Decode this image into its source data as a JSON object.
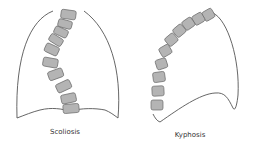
{
  "figures": [
    {
      "id": "scoliosis",
      "label": "Scoliosis"
    },
    {
      "id": "kyphosis",
      "label": "Kyphosis"
    }
  ],
  "colors": {
    "outline": "#555555",
    "vertebra_fill": "#b4b4b4",
    "vertebra_stroke": "#6a6a6a",
    "text": "#333333"
  }
}
